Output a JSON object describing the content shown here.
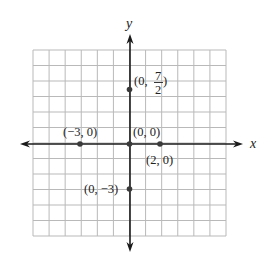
{
  "chart_data": {
    "type": "scatter",
    "title": "",
    "xlabel": "x",
    "ylabel": "y",
    "xlim": [
      -6,
      6
    ],
    "ylim": [
      -6,
      6
    ],
    "grid": true,
    "grid_step": 1,
    "axis_arrows": true,
    "points": [
      {
        "x": 0,
        "y": 3.5,
        "label": "(0, 7/2)",
        "label_parts": {
          "open": "(0,",
          "num": "7",
          "den": "2",
          "close": ")"
        }
      },
      {
        "x": -3,
        "y": 0,
        "label": "(−3, 0)"
      },
      {
        "x": 0,
        "y": 0,
        "label": "(0, 0)"
      },
      {
        "x": 2,
        "y": 0,
        "label": "(2, 0)"
      },
      {
        "x": 0,
        "y": -3,
        "label": "(0, −3)"
      }
    ]
  },
  "labels": {
    "x_axis": "x",
    "y_axis": "y",
    "p_seven_halves_open": "(0,",
    "p_seven_halves_num": "7",
    "p_seven_halves_den": "2",
    "p_seven_halves_close": ")",
    "p_neg3_0": "(−3, 0)",
    "p_origin": "(0, 0)",
    "p_2_0": "(2, 0)",
    "p_0_neg3": "(0, −3)"
  },
  "colors": {
    "grid": "#b9b9b9",
    "axis": "#1a1a1a",
    "point": "#3a3a3a"
  }
}
